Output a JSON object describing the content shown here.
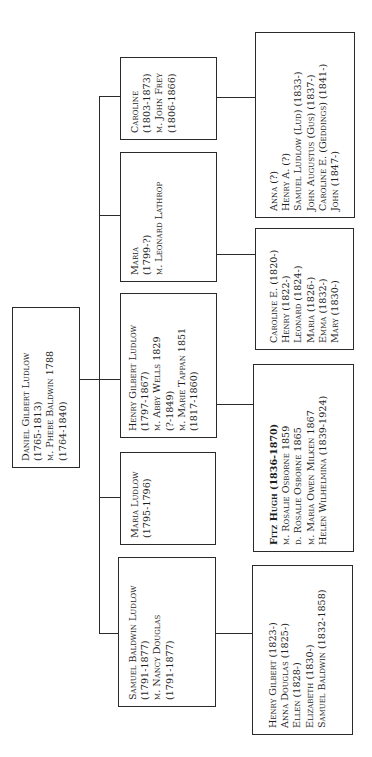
{
  "diagram": {
    "type": "family-tree",
    "orientation": "rotated-90-ccw",
    "line_color": "#2a2a2a",
    "root": {
      "id": "daniel",
      "lines": [
        "Daniel Gilbert Ludlow",
        "(1765-1813)",
        "m. Phebe Baldwin 1788",
        "(1764-1840)"
      ]
    },
    "children": [
      {
        "id": "caroline",
        "lines": [
          "Caroline",
          "(1803-1873)",
          "m. John Frey",
          "(1806-1866)"
        ],
        "descendants": {
          "id": "frey-children",
          "lines": [
            "Anna (?)",
            "Henry A. (?)",
            "Samuel Ludlow (Lud) (1833-)",
            "John Augustus (Gus) (1837-)",
            "Caroline E. (Geddings) (1841-)",
            "John (1847-)"
          ]
        }
      },
      {
        "id": "maria-lathrop",
        "lines": [
          "Maria",
          "(1799-?)",
          "m. Leonard Lathrop"
        ],
        "descendants": {
          "id": "lathrop-children",
          "lines": [
            "Caroline E. (1820-)",
            "Henry (1822-)",
            "Leonard (1824-)",
            "Maria (1826-)",
            "Emma (1832-)",
            "Mary (1830-)"
          ]
        }
      },
      {
        "id": "henry-gilbert",
        "lines": [
          "Henry Gilbert Ludlow",
          "(1797-1867)",
          "m. Abby Wells 1829",
          "(?-1849)",
          "m. Marie Tappan 1851",
          "(1817-1860)"
        ],
        "descendants": {
          "id": "fitz-hugh",
          "lines": [
            "Fitz Hugh (1836-1870)",
            "m. Rosalie Osborne 1859",
            "d. Rosalie Osborne 1865",
            "m. Maria Owen Milken 1867",
            "Helen Wilhelmina (1839-1924)"
          ],
          "bold_first_line": true
        }
      },
      {
        "id": "maria-ludlow",
        "lines": [
          "Maria Ludlow",
          "(1795-1796)"
        ]
      },
      {
        "id": "samuel-baldwin",
        "lines": [
          "Samuel Baldwin Ludlow",
          "(1791-1877)",
          "m. Nancy Douglas",
          "(1791-1877)"
        ],
        "descendants": {
          "id": "samuel-children",
          "lines": [
            "Henry Gilbert (1823-)",
            "Anna Douglas (1825-)",
            "Ellen (1828-)",
            "Elizabeth (1830-)",
            "Samuel Baldwin (1832-1858)"
          ]
        }
      }
    ]
  }
}
